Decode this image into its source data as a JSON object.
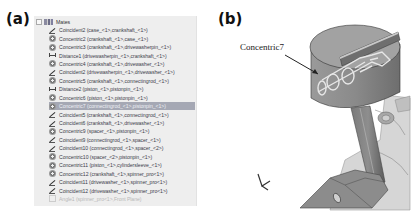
{
  "panels": {
    "a": {
      "label": "(a)"
    },
    "b": {
      "label": "(b)"
    }
  },
  "feature_tree": {
    "root_label": "Mates",
    "root_icon": "mates-folder-icon",
    "items": [
      {
        "type": "coincident",
        "icon": "coincident-icon",
        "label": "Coincident2 (case_<1>,crankshaft_<1>)"
      },
      {
        "type": "concentric",
        "icon": "concentric-icon",
        "label": "Concentric2 (crankshaft_<1>,case_<1>)"
      },
      {
        "type": "concentric",
        "icon": "concentric-icon",
        "label": "Concentric3 (crankshaft_<1>,drivewasherpin_<1>)"
      },
      {
        "type": "distance",
        "icon": "distance-icon",
        "label": "Distance1 (drivewasherpin_<1>,crankshaft_<1>)"
      },
      {
        "type": "concentric",
        "icon": "concentric-icon",
        "label": "Concentric4 (crankshaft_<1>,drivewasher_<1>)"
      },
      {
        "type": "coincident",
        "icon": "coincident-icon",
        "label": "Coincident2 (drivewasherpin_<1>,drivewasher_<1>)"
      },
      {
        "type": "concentric",
        "icon": "concentric-icon",
        "label": "Concentric5 (crankshaft_<1>,connectingrod_<1>)"
      },
      {
        "type": "distance",
        "icon": "distance-icon",
        "label": "Distance2 (piston_<1>,pistonpin_<1>)"
      },
      {
        "type": "concentric",
        "icon": "concentric-icon",
        "label": "Concentric6 (piston_<1>,pistonpin_<1>)"
      },
      {
        "type": "concentric",
        "icon": "concentric-icon",
        "label": "Concentric7 (connectingrod_<1>,pistonpin_<1>)",
        "selected": true
      },
      {
        "type": "coincident",
        "icon": "coincident-icon",
        "label": "Coincident5 (crankshaft_<1>,connectingrod_<1>)"
      },
      {
        "type": "coincident",
        "icon": "coincident-icon",
        "label": "Coincident6 (crankshaft_<1>,drivewasher_<1>)"
      },
      {
        "type": "concentric",
        "icon": "concentric-icon",
        "label": "Concentric9 (spacer_<1>,pistonpin_<1>)"
      },
      {
        "type": "coincident",
        "icon": "coincident-icon",
        "label": "Coincident9 (connectingrod_<1>,spacer_<1>)"
      },
      {
        "type": "coincident",
        "icon": "coincident-icon",
        "label": "Coincident10 (connectingrod_<1>,spacer_<2>)"
      },
      {
        "type": "concentric",
        "icon": "concentric-icon",
        "label": "Concentric10 (spacer_<2>,pistonpin_<1>)"
      },
      {
        "type": "concentric",
        "icon": "concentric-icon",
        "label": "Concentric11 (piston_<1>,cylindersleeve_<1>)"
      },
      {
        "type": "concentric",
        "icon": "concentric-icon",
        "label": "Concentric12 (crankshaft_<1>,spinner_pro<1>)"
      },
      {
        "type": "coincident",
        "icon": "coincident-icon",
        "label": "Coincident11 (drivewasher_<1>,spinner_pro<1>)"
      },
      {
        "type": "coincident",
        "icon": "coincident-icon",
        "label": "Coincident12 (drivewasher_<1>,spinner_pro<1>)"
      },
      {
        "type": "angle",
        "icon": "angle-icon",
        "label": "Angle1 (spinner_pro<1>,Front Plane)",
        "suppressed": true
      }
    ]
  },
  "model_view": {
    "callout_label": "Concentric7",
    "colors": {
      "piston": "#8c8c8c",
      "piston_top": "#a4a4a4",
      "rod": "#6e6e6e",
      "highlight": "#dcdcdc",
      "background": "#ffffff"
    }
  }
}
